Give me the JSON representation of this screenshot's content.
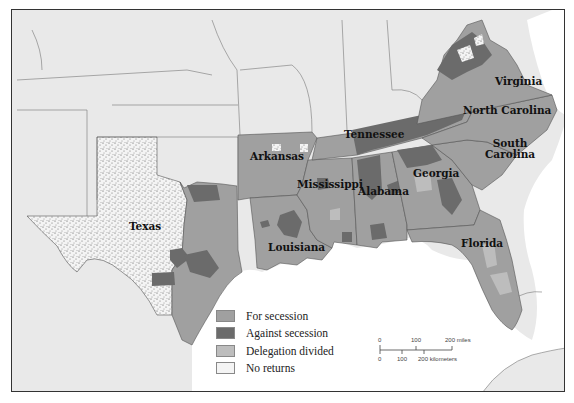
{
  "colors": {
    "outside_land": "#e9e9e9",
    "water": "#ffffff",
    "for_secession": "#a0a0a0",
    "against_secession": "#6b6b6b",
    "delegation_divided": "#bdbdbd",
    "no_returns": "#f4f4f4",
    "border": "#555555"
  },
  "states": [
    {
      "name": "Virginia",
      "label": "Virginia"
    },
    {
      "name": "North Carolina",
      "label": "North Carolina"
    },
    {
      "name": "Tennessee",
      "label": "Tennessee"
    },
    {
      "name": "Arkansas",
      "label": "Arkansas"
    },
    {
      "name": "South Carolina",
      "label_line1": "South",
      "label_line2": "Carolina"
    },
    {
      "name": "Mississippi",
      "label": "Mississippi"
    },
    {
      "name": "Alabama",
      "label": "Alabama"
    },
    {
      "name": "Georgia",
      "label": "Georgia"
    },
    {
      "name": "Texas",
      "label": "Texas"
    },
    {
      "name": "Louisiana",
      "label": "Louisiana"
    },
    {
      "name": "Florida",
      "label": "Florida"
    }
  ],
  "legend": {
    "items": [
      {
        "key": "for_secession",
        "label": "For secession"
      },
      {
        "key": "against_secession",
        "label": "Against secession"
      },
      {
        "key": "delegation_divided",
        "label": "Delegation divided"
      },
      {
        "key": "no_returns",
        "label": "No returns"
      }
    ]
  },
  "scale": {
    "miles_ticks": [
      "0",
      "100",
      "200 miles"
    ],
    "km_ticks": [
      "0",
      "100",
      "200 kilometers"
    ]
  }
}
